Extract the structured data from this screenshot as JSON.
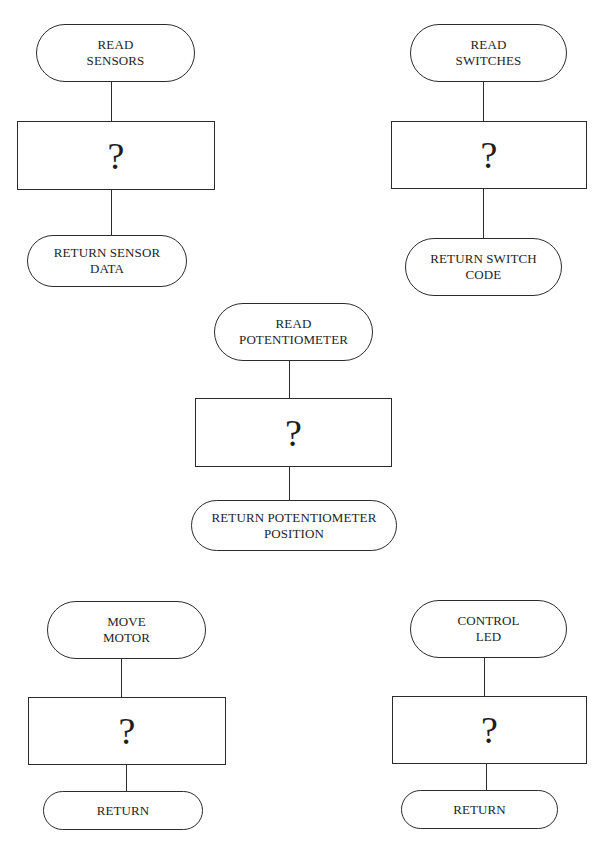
{
  "diagram": {
    "type": "flowchart-subroutines",
    "process_placeholder": "?",
    "flowcharts": [
      {
        "id": "read-sensors",
        "start_label": "READ\nSENSORS",
        "process_label": "?",
        "end_label": "RETURN SENSOR\nDATA"
      },
      {
        "id": "read-switches",
        "start_label": "READ\nSWITCHES",
        "process_label": "?",
        "end_label": "RETURN SWITCH\nCODE"
      },
      {
        "id": "read-potentiometer",
        "start_label": "READ\nPOTENTIOMETER",
        "process_label": "?",
        "end_label": "RETURN POTENTIOMETER\nPOSITION"
      },
      {
        "id": "move-motor",
        "start_label": "MOVE\nMOTOR",
        "process_label": "?",
        "end_label": "RETURN"
      },
      {
        "id": "control-led",
        "start_label": "CONTROL\nLED",
        "process_label": "?",
        "end_label": "RETURN"
      }
    ]
  },
  "colors": {
    "stroke": "#2b2b2b",
    "text": "#1e1e1e",
    "background": "#ffffff"
  }
}
